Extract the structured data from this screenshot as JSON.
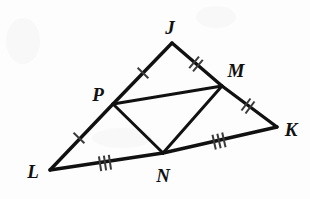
{
  "figure": {
    "width": 310,
    "height": 199,
    "background_color": "#fdfdfd",
    "stroke_color": "#111111",
    "tick_color": "#3a3a3a"
  },
  "vertices": [
    {
      "id": "J",
      "label": "J",
      "x": 172,
      "y": 43,
      "label_x": 170,
      "label_y": 27
    },
    {
      "id": "M",
      "label": "M",
      "x": 222,
      "y": 86,
      "label_x": 236,
      "label_y": 70
    },
    {
      "id": "K",
      "label": "K",
      "x": 277,
      "y": 127,
      "label_x": 291,
      "label_y": 129
    },
    {
      "id": "N",
      "label": "N",
      "x": 163,
      "y": 153,
      "label_x": 163,
      "label_y": 175
    },
    {
      "id": "L",
      "label": "L",
      "x": 50,
      "y": 170,
      "label_x": 33,
      "label_y": 171
    },
    {
      "id": "P",
      "label": "P",
      "x": 113,
      "y": 104,
      "label_x": 98,
      "label_y": 94
    }
  ],
  "segments": [
    {
      "id": "JP",
      "from": "J",
      "to": "P",
      "kind": "outer",
      "ticks": 1,
      "tick_x": 143,
      "tick_y": 73
    },
    {
      "id": "PL",
      "from": "P",
      "to": "L",
      "kind": "outer",
      "ticks": 1,
      "tick_x": 79,
      "tick_y": 138
    },
    {
      "id": "JM",
      "from": "J",
      "to": "M",
      "kind": "outer",
      "ticks": 2,
      "tick_x": 196,
      "tick_y": 64
    },
    {
      "id": "MK",
      "from": "M",
      "to": "K",
      "kind": "outer",
      "ticks": 2,
      "tick_x": 248,
      "tick_y": 106
    },
    {
      "id": "LN",
      "from": "L",
      "to": "N",
      "kind": "outer",
      "ticks": 3,
      "tick_x": 105,
      "tick_y": 163
    },
    {
      "id": "NK",
      "from": "N",
      "to": "K",
      "kind": "outer",
      "ticks": 3,
      "tick_x": 219,
      "tick_y": 141
    },
    {
      "id": "PM",
      "from": "P",
      "to": "M",
      "kind": "inner",
      "ticks": 0
    },
    {
      "id": "PN",
      "from": "P",
      "to": "N",
      "kind": "inner",
      "ticks": 0
    },
    {
      "id": "NM",
      "from": "N",
      "to": "M",
      "kind": "inner",
      "ticks": 0
    }
  ],
  "tick_style": {
    "length": 15,
    "spacing": 5
  }
}
